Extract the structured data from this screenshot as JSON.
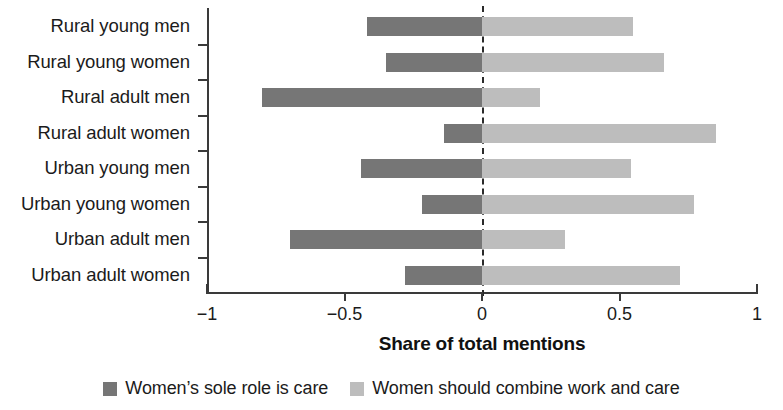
{
  "chart_data": {
    "type": "bar",
    "orientation": "horizontal",
    "title": "",
    "xlabel": "Share of total mentions",
    "ylabel": "",
    "xlim": [
      -1,
      1
    ],
    "xticks": [
      -1,
      -0.5,
      0,
      0.5,
      1
    ],
    "xticklabels": [
      "−1",
      "−0.5",
      "0",
      "0.5",
      "1"
    ],
    "grid": false,
    "zero_reference_line": true,
    "legend_position": "bottom",
    "categories": [
      "Rural young  men",
      "Rural young  women",
      "Rural adult men",
      "Rural adult women",
      "Urban young men",
      "Urban young women",
      "Urban adult men",
      "Urban adult women"
    ],
    "series": [
      {
        "name": "Women’s sole role is care",
        "color": "#767676",
        "values": [
          -0.42,
          -0.35,
          -0.8,
          -0.14,
          -0.44,
          -0.22,
          -0.7,
          -0.28
        ]
      },
      {
        "name": "Women should combine work and care",
        "color": "#bdbdbd",
        "values": [
          0.55,
          0.66,
          0.21,
          0.85,
          0.54,
          0.77,
          0.3,
          0.72
        ]
      }
    ]
  },
  "legend": {
    "items": [
      {
        "label": "Women’s sole role is care",
        "swatch": "dark"
      },
      {
        "label": "Women should combine work and care",
        "swatch": "light"
      }
    ]
  },
  "axis": {
    "title": "Share of total mentions"
  },
  "colors": {
    "sole_role": "#767676",
    "combine": "#bdbdbd",
    "axis": "#3a3a3a",
    "text": "#1b1b1b",
    "background": "#ffffff"
  }
}
